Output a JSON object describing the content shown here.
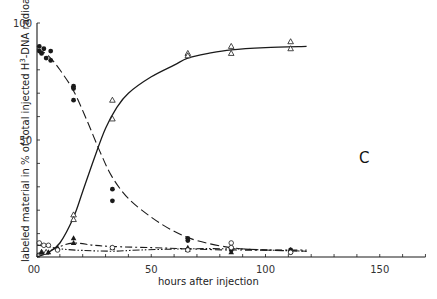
{
  "chart_data": {
    "type": "line",
    "title": "",
    "panel_label": "C",
    "xlabel": "hours after injection",
    "ylabel": "labeled material in % of total injected H3-DNA radioactivity",
    "ylabel_parts": {
      "before": "labeled material in % of total injected H",
      "sup": "3",
      "after": "-DNA radioactivity"
    },
    "xlim": [
      0,
      170
    ],
    "ylim": [
      0,
      100
    ],
    "x_ticks": [
      0,
      50,
      100,
      150
    ],
    "x_tick_labels": [
      "0",
      "50",
      "100",
      "150"
    ],
    "x_minor_step": 10,
    "y_ticks": [
      0,
      50,
      100
    ],
    "y_tick_labels": [
      "0",
      "50",
      "100"
    ],
    "y_minor_step": 10,
    "grid": false,
    "legend": null,
    "series": [
      {
        "name": "filled circles (DNA)",
        "marker": "filled-circle",
        "line": "dashed",
        "points": [
          [
            1,
            90
          ],
          [
            1,
            88
          ],
          [
            2,
            87
          ],
          [
            3,
            89
          ],
          [
            4,
            85
          ],
          [
            6,
            88
          ],
          [
            6,
            84
          ],
          [
            16,
            73
          ],
          [
            16,
            72
          ],
          [
            16,
            67
          ],
          [
            33,
            29
          ],
          [
            33,
            24
          ],
          [
            66,
            8
          ],
          [
            66,
            7
          ],
          [
            85,
            4
          ],
          [
            85,
            3
          ],
          [
            111,
            3
          ],
          [
            111,
            2
          ]
        ],
        "curve": [
          [
            0,
            89
          ],
          [
            5,
            86
          ],
          [
            10,
            80
          ],
          [
            16,
            71
          ],
          [
            22,
            58
          ],
          [
            28,
            44
          ],
          [
            33,
            34
          ],
          [
            40,
            25
          ],
          [
            50,
            17
          ],
          [
            60,
            11
          ],
          [
            70,
            7
          ],
          [
            85,
            4
          ],
          [
            100,
            3
          ],
          [
            118,
            2.5
          ]
        ]
      },
      {
        "name": "open triangles",
        "marker": "open-triangle",
        "line": "solid",
        "points": [
          [
            2,
            2
          ],
          [
            4,
            2
          ],
          [
            16,
            18
          ],
          [
            16,
            16
          ],
          [
            33,
            67
          ],
          [
            33,
            59
          ],
          [
            66,
            87
          ],
          [
            66,
            86
          ],
          [
            85,
            90
          ],
          [
            85,
            87
          ],
          [
            111,
            92
          ],
          [
            111,
            89
          ]
        ],
        "curve": [
          [
            0,
            0
          ],
          [
            5,
            2
          ],
          [
            10,
            6
          ],
          [
            16,
            17
          ],
          [
            20,
            28
          ],
          [
            25,
            42
          ],
          [
            30,
            55
          ],
          [
            35,
            64
          ],
          [
            40,
            70
          ],
          [
            50,
            77
          ],
          [
            60,
            82
          ],
          [
            66,
            85
          ],
          [
            75,
            87
          ],
          [
            85,
            88.5
          ],
          [
            100,
            89.5
          ],
          [
            118,
            90
          ]
        ]
      },
      {
        "name": "filled triangles",
        "marker": "filled-triangle",
        "line": "dash-dot",
        "points": [
          [
            2,
            2
          ],
          [
            5,
            2
          ],
          [
            9,
            4
          ],
          [
            16,
            8
          ],
          [
            16,
            6
          ],
          [
            33,
            4
          ],
          [
            66,
            4
          ],
          [
            66,
            3
          ],
          [
            85,
            2
          ],
          [
            111,
            3
          ]
        ],
        "curve": [
          [
            0,
            1.5
          ],
          [
            5,
            2.5
          ],
          [
            10,
            4.5
          ],
          [
            16,
            6
          ],
          [
            25,
            5
          ],
          [
            33,
            4.5
          ],
          [
            50,
            4
          ],
          [
            66,
            3.5
          ],
          [
            85,
            3
          ],
          [
            118,
            3
          ]
        ]
      },
      {
        "name": "open circles",
        "marker": "open-circle",
        "line": "dash-dot-dot",
        "points": [
          [
            1,
            6
          ],
          [
            3,
            5
          ],
          [
            5,
            5
          ],
          [
            9,
            3
          ],
          [
            33,
            4
          ],
          [
            66,
            3
          ],
          [
            85,
            6
          ],
          [
            85,
            4
          ],
          [
            111,
            2
          ]
        ],
        "curve": [
          [
            0,
            5
          ],
          [
            5,
            4.5
          ],
          [
            10,
            3.5
          ],
          [
            20,
            2.8
          ],
          [
            33,
            2.5
          ],
          [
            45,
            3
          ],
          [
            66,
            3.5
          ],
          [
            85,
            3.5
          ],
          [
            100,
            3
          ],
          [
            118,
            2.5
          ]
        ]
      }
    ]
  },
  "colors": {
    "background": "#ffffff",
    "ink": "#1a1a1a",
    "text": "#333333"
  }
}
